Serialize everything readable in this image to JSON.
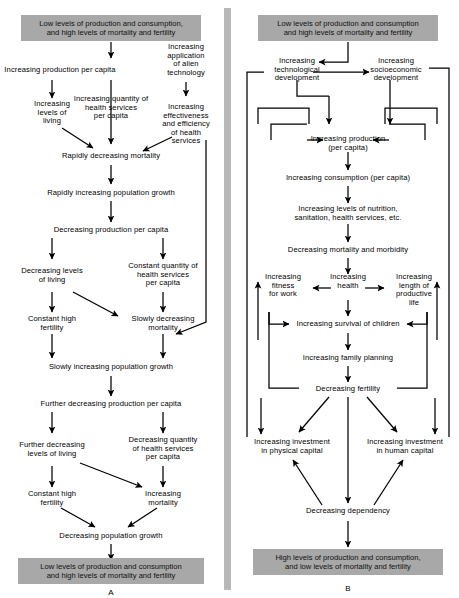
{
  "figure": {
    "panels": [
      "A",
      "B"
    ],
    "colors": {
      "band": "#a8a8a8",
      "line": "#000000",
      "divider": "#b8b8b8",
      "background": "#ffffff"
    }
  },
  "panelA": {
    "label": "A",
    "top_band": "Low levels of production and consumption,\nand high levels of mortality and fertility",
    "bottom_band": "Low levels of production and consumption\nand high levels of mortality and fertility",
    "nodes": [
      {
        "id": "a1",
        "text": "Increasing production per capita"
      },
      {
        "id": "a2",
        "text": "Increasing quantity of\nhealth services\nper capita"
      },
      {
        "id": "a3",
        "text": "Increasing\napplication\nof alien\ntechnology"
      },
      {
        "id": "a4",
        "text": "Increasing\nlevels of\nliving"
      },
      {
        "id": "a5",
        "text": "Increasing\neffectiveness\nand efficiency\nof health\nservices"
      },
      {
        "id": "a6",
        "text": "Rapidly decreasing mortality"
      },
      {
        "id": "a7",
        "text": "Rapidly increasing population growth"
      },
      {
        "id": "a8",
        "text": "Decreasing production per capita"
      },
      {
        "id": "a9",
        "text": "Decreasing levels\nof living"
      },
      {
        "id": "a10",
        "text": "Constant quantity of\nhealth services\nper capita"
      },
      {
        "id": "a11",
        "text": "Constant high\nfertility"
      },
      {
        "id": "a12",
        "text": "Slowly decreasing\nmortality"
      },
      {
        "id": "a13",
        "text": "Slowly increasing population growth"
      },
      {
        "id": "a14",
        "text": "Further decreasing production per capita"
      },
      {
        "id": "a15",
        "text": "Further decreasing\nlevels of living"
      },
      {
        "id": "a16",
        "text": "Decreasing quantity\nof health services\nper capita"
      },
      {
        "id": "a17",
        "text": "Constant high\nfertility"
      },
      {
        "id": "a18",
        "text": "Increasing\nmortality"
      },
      {
        "id": "a19",
        "text": "Decreasing population growth"
      }
    ]
  },
  "panelB": {
    "label": "B",
    "top_band": "Low levels of production and consumption\nand high levels of mortality and fertility",
    "bottom_band": "High levels of production and consumption,\nand low levels of mortality and fertility",
    "nodes": [
      {
        "id": "b1",
        "text": "Increasing\ntechnological\ndevelopment"
      },
      {
        "id": "b2",
        "text": "Increasing\nsocioeconomic\ndevelopment"
      },
      {
        "id": "b3",
        "text": "Increasing production\n(per capita)"
      },
      {
        "id": "b4",
        "text": "Increasing consumption (per capita)"
      },
      {
        "id": "b5",
        "text": "Increasing levels of nutrition,\nsanitation, health services, etc."
      },
      {
        "id": "b6",
        "text": "Decreasing mortality and morbidity"
      },
      {
        "id": "b7",
        "text": "Increasing\nfitness\nfor work"
      },
      {
        "id": "b8",
        "text": "Increasing\nhealth"
      },
      {
        "id": "b9",
        "text": "Increasing\nlength of\nproductive\nlife"
      },
      {
        "id": "b10",
        "text": "Increasing survival of children"
      },
      {
        "id": "b11",
        "text": "Increasing family planning"
      },
      {
        "id": "b12",
        "text": "Decreasing fertility"
      },
      {
        "id": "b13",
        "text": "Increasing investment\nin physical capital"
      },
      {
        "id": "b14",
        "text": "Increasing investment\nin human capital"
      },
      {
        "id": "b15",
        "text": "Decreasing dependency"
      }
    ]
  }
}
